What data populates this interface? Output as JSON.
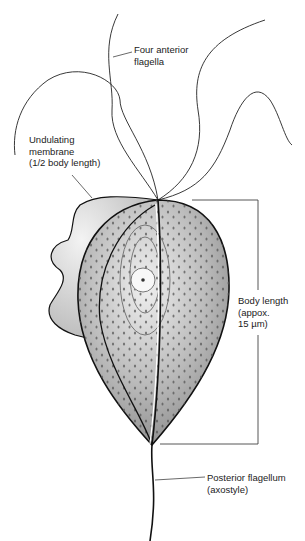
{
  "figure": {
    "labels": {
      "anterior_flagella": [
        "Four anterior",
        "flagella"
      ],
      "undulating_membrane": [
        "Undulating",
        "membrane",
        "(1/2 body length)"
      ],
      "body_length": [
        "Body length",
        "(appox.",
        "15 µm)"
      ],
      "posterior_flagellum": [
        "Posterior flagellum",
        "(axostyle)"
      ]
    },
    "colors": {
      "body_fill": "#a8a8a8",
      "body_highlight": "#e6e6e6",
      "outline": "#111111",
      "dots": "#555555",
      "membrane_fill": "#d9d9d9"
    }
  }
}
